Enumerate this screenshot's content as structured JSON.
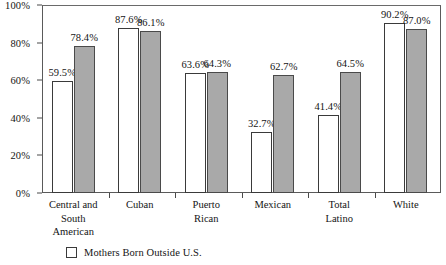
{
  "chart_data": {
    "type": "bar",
    "title": "",
    "subtitle": "",
    "xlabel": "",
    "ylabel": "",
    "ylim": [
      0,
      100
    ],
    "yticks": [
      "0%",
      "20%",
      "40%",
      "60%",
      "80%",
      "100%"
    ],
    "ytick_values": [
      0,
      20,
      40,
      60,
      80,
      100
    ],
    "grid": false,
    "legend_position": "bottom-left",
    "value_suffix": "%",
    "categories": [
      "Central and\nSouth\nAmerican",
      "Cuban",
      "Puerto\nRican",
      "Mexican",
      "Total\nLatino",
      "White"
    ],
    "series": [
      {
        "name": "Mothers Born Outside U.S.",
        "style": "white-outline",
        "color": "#ffffff",
        "values": [
          59.5,
          87.6,
          63.6,
          32.7,
          41.4,
          90.2
        ],
        "labels": [
          "59.5%",
          "87.6%",
          "63.6%",
          "32.7%",
          "41.4%",
          "90.2%"
        ]
      },
      {
        "name": "",
        "style": "gray-filled",
        "color": "#a9a9a9",
        "values": [
          78.4,
          86.1,
          64.3,
          62.7,
          64.5,
          87.0
        ],
        "labels": [
          "78.4%",
          "86.1%",
          "64.3%",
          "62.7%",
          "64.5%",
          "87.0%"
        ]
      }
    ]
  },
  "legend": {
    "items": [
      {
        "label": "Mothers Born Outside U.S.",
        "swatch": "white-outline"
      }
    ]
  },
  "axis_colors": {
    "frame": "#5a5a5a",
    "tick": "#4a4a4a",
    "bar_outline": "#3a3a3a",
    "bar_gray": "#a9a9a9"
  }
}
